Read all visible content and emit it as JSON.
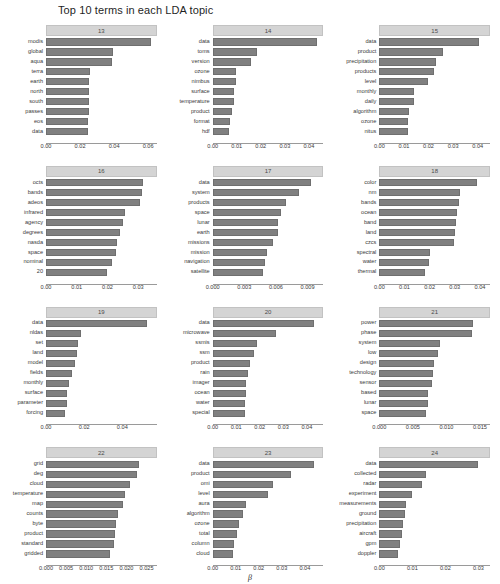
{
  "chart_data": {
    "type": "bar",
    "title": "Top 10 terms in each LDA topic",
    "xlabel": "β",
    "ylabel": "",
    "orientation": "horizontal",
    "grid": false,
    "legend": false,
    "facet_layout": {
      "rows": 4,
      "cols": 3
    },
    "panels": [
      {
        "id": "13",
        "xlim": [
          0,
          0.065
        ],
        "xticks": [
          0.0,
          0.02,
          0.04,
          0.06
        ],
        "xticklabels": [
          "0.00",
          "0.02",
          "0.04",
          "0.06"
        ],
        "categories": [
          "modis",
          "global",
          "aqua",
          "terra",
          "earth",
          "north",
          "south",
          "passes",
          "eos",
          "data"
        ],
        "values": [
          0.0615,
          0.0395,
          0.039,
          0.0257,
          0.0253,
          0.025,
          0.025,
          0.025,
          0.0248,
          0.0248
        ]
      },
      {
        "id": "14",
        "xlim": [
          0,
          0.046
        ],
        "xticks": [
          0.0,
          0.01,
          0.02,
          0.03,
          0.04
        ],
        "xticklabels": [
          "0.00",
          "0.01",
          "0.02",
          "0.03",
          "0.04"
        ],
        "categories": [
          "data",
          "toms",
          "version",
          "ozone",
          "nimbus",
          "surface",
          "temperature",
          "product",
          "format",
          "hdf"
        ],
        "values": [
          0.0435,
          0.0185,
          0.0158,
          0.0098,
          0.0095,
          0.0088,
          0.0088,
          0.0082,
          0.0072,
          0.0068
        ]
      },
      {
        "id": "15",
        "xlim": [
          0,
          0.045
        ],
        "xticks": [
          0.0,
          0.01,
          0.02,
          0.03,
          0.04
        ],
        "xticklabels": [
          "0.00",
          "0.01",
          "0.02",
          "0.03",
          "0.04"
        ],
        "categories": [
          "data",
          "product",
          "precipitation",
          "products",
          "level",
          "monthly",
          "daily",
          "algorithm",
          "ozone",
          "nitus"
        ],
        "values": [
          0.0405,
          0.026,
          0.023,
          0.0222,
          0.0198,
          0.0143,
          0.0141,
          0.012,
          0.0118,
          0.0115
        ]
      },
      {
        "id": "16",
        "xlim": [
          0,
          0.036
        ],
        "xticks": [
          0.0,
          0.01,
          0.02,
          0.03
        ],
        "xticklabels": [
          "0.00",
          "0.01",
          "0.02",
          "0.03"
        ],
        "categories": [
          "octs",
          "bands",
          "adeos",
          "infrared",
          "agency",
          "degrees",
          "nasda",
          "space",
          "nominal",
          "20"
        ],
        "values": [
          0.0315,
          0.0313,
          0.0307,
          0.0258,
          0.0252,
          0.024,
          0.0232,
          0.0228,
          0.0215,
          0.02
        ]
      },
      {
        "id": "17",
        "xlim": [
          0,
          0.0105
        ],
        "xticks": [
          0.0,
          0.003,
          0.006,
          0.009
        ],
        "xticklabels": [
          "0.000",
          "0.003",
          "0.006",
          "0.009"
        ],
        "categories": [
          "data",
          "system",
          "products",
          "space",
          "lunar",
          "earth",
          "missions",
          "mission",
          "navigation",
          "satellite"
        ],
        "values": [
          0.0093,
          0.0082,
          0.007,
          0.0065,
          0.0062,
          0.0062,
          0.0057,
          0.0052,
          0.005,
          0.0048
        ]
      },
      {
        "id": "18",
        "xlim": [
          0,
          0.044
        ],
        "xticks": [
          0.0,
          0.01,
          0.02,
          0.03,
          0.04
        ],
        "xticklabels": [
          "0.00",
          "0.01",
          "0.02",
          "0.03",
          "0.04"
        ],
        "categories": [
          "color",
          "nm",
          "bands",
          "ocean",
          "band",
          "land",
          "czcs",
          "spectral",
          "water",
          "thermal"
        ],
        "values": [
          0.039,
          0.032,
          0.0318,
          0.031,
          0.0305,
          0.03,
          0.0297,
          0.02,
          0.0198,
          0.0182
        ]
      },
      {
        "id": "19",
        "xlim": [
          0,
          0.058
        ],
        "xticks": [
          0.0,
          0.02,
          0.04
        ],
        "xticklabels": [
          "0.00",
          "0.02",
          "0.04"
        ],
        "categories": [
          "data",
          "nldas",
          "set",
          "land",
          "model",
          "fields",
          "monthly",
          "surface",
          "parameter",
          "forcing"
        ],
        "values": [
          0.053,
          0.0185,
          0.0168,
          0.0165,
          0.015,
          0.0137,
          0.0118,
          0.0112,
          0.0108,
          0.01
        ]
      },
      {
        "id": "20",
        "xlim": [
          0,
          0.047
        ],
        "xticks": [
          0.0,
          0.01,
          0.02,
          0.03,
          0.04
        ],
        "xticklabels": [
          "0.00",
          "0.01",
          "0.02",
          "0.03",
          "0.04"
        ],
        "categories": [
          "data",
          "microwave",
          "ssmis",
          "ssm",
          "product",
          "rain",
          "imager",
          "ocean",
          "water",
          "special"
        ],
        "values": [
          0.043,
          0.027,
          0.019,
          0.0175,
          0.016,
          0.0152,
          0.0142,
          0.014,
          0.0138,
          0.0136
        ]
      },
      {
        "id": "21",
        "xlim": [
          0,
          0.0165
        ],
        "xticks": [
          0.0,
          0.005,
          0.01,
          0.015
        ],
        "xticklabels": [
          "0.000",
          "0.005",
          "0.010",
          "0.015"
        ],
        "categories": [
          "power",
          "phase",
          "system",
          "low",
          "design",
          "technology",
          "sensor",
          "based",
          "lunar",
          "space"
        ],
        "values": [
          0.014,
          0.0138,
          0.009,
          0.0088,
          0.0082,
          0.008,
          0.0078,
          0.0073,
          0.0072,
          0.007
        ]
      },
      {
        "id": "22",
        "xlim": [
          0,
          0.0275
        ],
        "xticks": [
          0.0,
          0.005,
          0.01,
          0.015,
          0.02,
          0.025
        ],
        "xticklabels": [
          "0.000",
          "0.005",
          "0.010",
          "0.015",
          "0.020",
          "0.025"
        ],
        "categories": [
          "grid",
          "deg",
          "cloud",
          "temperature",
          "map",
          "counts",
          "byte",
          "product",
          "standard",
          "gridded"
        ],
        "values": [
          0.0232,
          0.0225,
          0.0208,
          0.0197,
          0.0192,
          0.018,
          0.0175,
          0.0172,
          0.017,
          0.016
        ]
      },
      {
        "id": "23",
        "xlim": [
          0,
          0.048
        ],
        "xticks": [
          0.0,
          0.01,
          0.02,
          0.03,
          0.04
        ],
        "xticklabels": [
          "0.00",
          "0.01",
          "0.02",
          "0.03",
          "0.04"
        ],
        "categories": [
          "data",
          "product",
          "omi",
          "level",
          "aura",
          "algorithm",
          "ozone",
          "total",
          "column",
          "cloud"
        ],
        "values": [
          0.044,
          0.0338,
          0.0262,
          0.0238,
          0.0145,
          0.0132,
          0.0115,
          0.0105,
          0.0092,
          0.009
        ]
      },
      {
        "id": "24",
        "xlim": [
          0,
          0.0335
        ],
        "xticks": [
          0.0,
          0.01,
          0.02,
          0.03
        ],
        "xticklabels": [
          "0.00",
          "0.01",
          "0.02",
          "0.03"
        ],
        "categories": [
          "data",
          "collected",
          "radar",
          "experiment",
          "measurements",
          "ground",
          "precipitation",
          "aircraft",
          "gpm",
          "doppler"
        ],
        "values": [
          0.03,
          0.014,
          0.013,
          0.0098,
          0.0082,
          0.0078,
          0.0072,
          0.007,
          0.0062,
          0.0058
        ]
      }
    ]
  },
  "style": {
    "bar_color": "#808080",
    "strip_color": "#d4d4d4",
    "background": "#ffffff",
    "text_color": "#2b2b2b"
  }
}
